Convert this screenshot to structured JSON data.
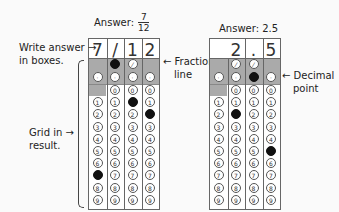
{
  "left_panel": {
    "title_prefix": "Answer:",
    "fraction_num": "7",
    "fraction_den": "12",
    "answer_chars": [
      "7",
      "/",
      "1",
      "2"
    ],
    "filled": {
      "row_slash": [
        1
      ],
      "row_dot": [],
      "digits": {
        "0": [],
        "1": [
          2
        ],
        "2": [
          3
        ],
        "7": [
          0
        ]
      }
    },
    "callouts": {
      "write_answer_1": "Write answer",
      "write_answer_2": "in boxes.",
      "grid_in_1": "Grid in",
      "grid_in_2": "result.",
      "fraction_line_1": "Fraction",
      "fraction_line_2": "line"
    }
  },
  "right_panel": {
    "title": "Answer: 2.5",
    "answer_chars": [
      "",
      "2",
      ".",
      "5"
    ],
    "callouts": {
      "decimal_1": "Decimal",
      "decimal_2": "point"
    }
  },
  "digits": [
    "0",
    "1",
    "2",
    "3",
    "4",
    "5",
    "6",
    "7",
    "8",
    "9"
  ]
}
